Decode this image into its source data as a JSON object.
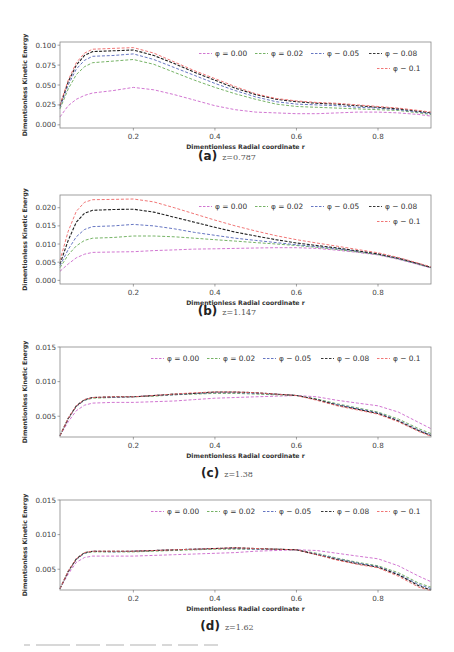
{
  "figure": {
    "footer_text_fragment": "(cut-off caption text)"
  },
  "chart_data": [
    {
      "id": "a",
      "type": "line",
      "caption_letter": "(a)",
      "caption_z": "z=0.787",
      "xlabel": "Dimentionless Radial coordinate r",
      "ylabel": "Dimentionless Kinetic Energy",
      "xlim": [
        0.02,
        0.93
      ],
      "ylim": [
        -0.004,
        0.104
      ],
      "xticks": [
        0.2,
        0.4,
        0.6,
        0.8
      ],
      "xtick_labels": [
        "0.2",
        "0.4",
        "0.6",
        "0.8"
      ],
      "yticks": [
        0.0,
        0.025,
        0.05,
        0.075,
        0.1
      ],
      "ytick_labels": [
        "0.000",
        "0.025",
        "0.050",
        "0.075",
        "0.100"
      ],
      "grid": false,
      "legend_position": "upper right",
      "legend_rows": [
        [
          0,
          1,
          2,
          3
        ],
        [
          4
        ]
      ],
      "x": [
        0.02,
        0.04,
        0.06,
        0.08,
        0.1,
        0.15,
        0.2,
        0.25,
        0.3,
        0.35,
        0.4,
        0.45,
        0.5,
        0.55,
        0.6,
        0.65,
        0.7,
        0.75,
        0.8,
        0.85,
        0.9,
        0.93
      ],
      "series": [
        {
          "name": "φ = 0.00",
          "color": "#cc66cc",
          "values": [
            0.01,
            0.024,
            0.032,
            0.037,
            0.04,
            0.043,
            0.047,
            0.044,
            0.038,
            0.031,
            0.024,
            0.019,
            0.016,
            0.015,
            0.014,
            0.014,
            0.015,
            0.016,
            0.016,
            0.015,
            0.013,
            0.011
          ]
        },
        {
          "name": "φ = 0.02",
          "color": "#66aa55",
          "values": [
            0.02,
            0.045,
            0.063,
            0.073,
            0.078,
            0.08,
            0.082,
            0.076,
            0.066,
            0.056,
            0.047,
            0.039,
            0.032,
            0.026,
            0.023,
            0.022,
            0.021,
            0.02,
            0.019,
            0.018,
            0.015,
            0.013
          ]
        },
        {
          "name": "φ − 0.05",
          "color": "#5566bb",
          "values": [
            0.022,
            0.05,
            0.07,
            0.081,
            0.086,
            0.087,
            0.089,
            0.082,
            0.072,
            0.062,
            0.052,
            0.043,
            0.035,
            0.029,
            0.026,
            0.025,
            0.024,
            0.022,
            0.021,
            0.019,
            0.016,
            0.014
          ]
        },
        {
          "name": "φ − 0.08",
          "color": "#222222",
          "values": [
            0.024,
            0.054,
            0.075,
            0.087,
            0.092,
            0.093,
            0.094,
            0.087,
            0.077,
            0.066,
            0.056,
            0.046,
            0.038,
            0.032,
            0.029,
            0.027,
            0.026,
            0.024,
            0.022,
            0.02,
            0.017,
            0.015
          ]
        },
        {
          "name": "φ − 0.1",
          "color": "#ee6666",
          "values": [
            0.025,
            0.056,
            0.078,
            0.09,
            0.095,
            0.096,
            0.097,
            0.09,
            0.079,
            0.068,
            0.058,
            0.048,
            0.039,
            0.033,
            0.03,
            0.028,
            0.027,
            0.025,
            0.023,
            0.021,
            0.018,
            0.016
          ]
        }
      ]
    },
    {
      "id": "b",
      "type": "line",
      "caption_letter": "(b)",
      "caption_z": "z=1.147",
      "xlabel": "Dimentionless Radial coordinate r",
      "ylabel": "Dimentionless Kinetic Energy",
      "xlim": [
        0.02,
        0.93
      ],
      "ylim": [
        -0.001,
        0.0235
      ],
      "xticks": [
        0.2,
        0.4,
        0.6,
        0.8
      ],
      "xtick_labels": [
        "0.2",
        "0.4",
        "0.6",
        "0.8"
      ],
      "yticks": [
        0.0,
        0.005,
        0.01,
        0.015,
        0.02
      ],
      "ytick_labels": [
        "0.000",
        "0.005",
        "0.010",
        "0.015",
        "0.020"
      ],
      "grid": false,
      "legend_position": "upper right",
      "legend_rows": [
        [
          0,
          1,
          2,
          3
        ],
        [
          4
        ]
      ],
      "x": [
        0.02,
        0.04,
        0.06,
        0.08,
        0.1,
        0.15,
        0.2,
        0.25,
        0.3,
        0.35,
        0.4,
        0.45,
        0.5,
        0.55,
        0.6,
        0.65,
        0.7,
        0.75,
        0.8,
        0.85,
        0.9,
        0.93
      ],
      "series": [
        {
          "name": "φ = 0.00",
          "color": "#cc66cc",
          "values": [
            0.0025,
            0.0045,
            0.0062,
            0.0072,
            0.0077,
            0.0078,
            0.0079,
            0.0082,
            0.0084,
            0.0086,
            0.0087,
            0.0088,
            0.0089,
            0.009,
            0.009,
            0.0088,
            0.0083,
            0.0077,
            0.007,
            0.0058,
            0.0043,
            0.0034
          ]
        },
        {
          "name": "φ = 0.02",
          "color": "#66aa55",
          "values": [
            0.0035,
            0.007,
            0.0095,
            0.011,
            0.0116,
            0.0118,
            0.0122,
            0.0122,
            0.012,
            0.0116,
            0.0112,
            0.0108,
            0.0104,
            0.01,
            0.0096,
            0.0091,
            0.0085,
            0.0078,
            0.0071,
            0.0059,
            0.0044,
            0.0035
          ]
        },
        {
          "name": "φ − 0.05",
          "color": "#5566bb",
          "values": [
            0.004,
            0.0085,
            0.012,
            0.014,
            0.0148,
            0.015,
            0.0154,
            0.015,
            0.0142,
            0.0132,
            0.0124,
            0.0116,
            0.011,
            0.0104,
            0.0098,
            0.0093,
            0.0087,
            0.008,
            0.0072,
            0.006,
            0.0045,
            0.0035
          ]
        },
        {
          "name": "φ − 0.08",
          "color": "#222222",
          "values": [
            0.0045,
            0.011,
            0.016,
            0.0185,
            0.0193,
            0.0195,
            0.0196,
            0.0188,
            0.0174,
            0.016,
            0.0146,
            0.0133,
            0.0122,
            0.0112,
            0.0103,
            0.0096,
            0.0089,
            0.0081,
            0.0073,
            0.0061,
            0.0046,
            0.0036
          ]
        },
        {
          "name": "φ − 0.1",
          "color": "#ee6666",
          "values": [
            0.0055,
            0.0135,
            0.019,
            0.0215,
            0.0222,
            0.0223,
            0.0224,
            0.0216,
            0.02,
            0.0183,
            0.0166,
            0.015,
            0.0136,
            0.0123,
            0.0112,
            0.0103,
            0.0094,
            0.0085,
            0.0076,
            0.0063,
            0.0047,
            0.0037
          ]
        }
      ]
    },
    {
      "id": "c",
      "type": "line",
      "caption_letter": "(c)",
      "caption_z": "z=1.38",
      "xlabel": "Dimentionless Radial coordinate r",
      "ylabel": "Dimentionless Kinetic Energy",
      "xlim": [
        0.02,
        0.93
      ],
      "ylim": [
        0.002,
        0.015
      ],
      "xticks": [
        0.2,
        0.4,
        0.6,
        0.8
      ],
      "xtick_labels": [
        "0.2",
        "0.4",
        "0.6",
        "0.8"
      ],
      "yticks": [
        0.005,
        0.01,
        0.015
      ],
      "ytick_labels": [
        "0.005",
        "0.010",
        "0.015"
      ],
      "grid": false,
      "legend_position": "upper right",
      "legend_rows": [
        [
          0,
          1,
          2,
          3,
          4
        ]
      ],
      "x": [
        0.02,
        0.04,
        0.06,
        0.08,
        0.1,
        0.15,
        0.2,
        0.25,
        0.3,
        0.35,
        0.4,
        0.45,
        0.5,
        0.55,
        0.6,
        0.65,
        0.7,
        0.75,
        0.8,
        0.85,
        0.9,
        0.93
      ],
      "series": [
        {
          "name": "φ = 0.00",
          "color": "#cc66cc",
          "values": [
            0.0022,
            0.0042,
            0.0058,
            0.0066,
            0.0069,
            0.007,
            0.007,
            0.0071,
            0.0072,
            0.0074,
            0.0076,
            0.0077,
            0.0078,
            0.0079,
            0.008,
            0.0078,
            0.0073,
            0.0069,
            0.0065,
            0.0056,
            0.0041,
            0.0032
          ]
        },
        {
          "name": "φ = 0.02",
          "color": "#66aa55",
          "values": [
            0.0022,
            0.0046,
            0.0064,
            0.0073,
            0.0076,
            0.0077,
            0.0078,
            0.0079,
            0.0081,
            0.0082,
            0.0083,
            0.0083,
            0.0082,
            0.0081,
            0.008,
            0.0075,
            0.0068,
            0.0062,
            0.0056,
            0.0046,
            0.0032,
            0.0025
          ]
        },
        {
          "name": "φ − 0.05",
          "color": "#5566bb",
          "values": [
            0.0022,
            0.0046,
            0.0064,
            0.0073,
            0.0077,
            0.0077,
            0.0078,
            0.008,
            0.0081,
            0.0083,
            0.0084,
            0.0084,
            0.0083,
            0.0082,
            0.008,
            0.0074,
            0.0067,
            0.0061,
            0.0055,
            0.0044,
            0.003,
            0.0023
          ]
        },
        {
          "name": "φ − 0.08",
          "color": "#222222",
          "values": [
            0.0022,
            0.0047,
            0.0065,
            0.0074,
            0.0077,
            0.0078,
            0.0078,
            0.008,
            0.0082,
            0.0083,
            0.0085,
            0.0085,
            0.0084,
            0.0082,
            0.008,
            0.0074,
            0.0066,
            0.006,
            0.0054,
            0.0043,
            0.0029,
            0.0022
          ]
        },
        {
          "name": "φ − 0.1",
          "color": "#ee6666",
          "values": [
            0.0022,
            0.0047,
            0.0065,
            0.0074,
            0.0077,
            0.0078,
            0.0078,
            0.008,
            0.0082,
            0.0084,
            0.0085,
            0.0085,
            0.0084,
            0.0082,
            0.008,
            0.0073,
            0.0065,
            0.0059,
            0.0053,
            0.0042,
            0.0028,
            0.0021
          ]
        }
      ]
    },
    {
      "id": "d",
      "type": "line",
      "caption_letter": "(d)",
      "caption_z": "z=1.62",
      "xlabel": "Dimentionless Radial coordinate r",
      "ylabel": "Dimentionless Kinetic Energy",
      "xlim": [
        0.02,
        0.93
      ],
      "ylim": [
        0.002,
        0.015
      ],
      "xticks": [
        0.2,
        0.4,
        0.6,
        0.8
      ],
      "xtick_labels": [
        "0.2",
        "0.4",
        "0.6",
        "0.8"
      ],
      "yticks": [
        0.005,
        0.01,
        0.015
      ],
      "ytick_labels": [
        "0.005",
        "0.010",
        "0.015"
      ],
      "grid": false,
      "legend_position": "upper right",
      "legend_rows": [
        [
          0,
          1,
          2,
          3,
          4
        ]
      ],
      "x": [
        0.02,
        0.04,
        0.06,
        0.08,
        0.1,
        0.15,
        0.2,
        0.25,
        0.3,
        0.35,
        0.4,
        0.45,
        0.5,
        0.55,
        0.6,
        0.65,
        0.7,
        0.75,
        0.8,
        0.85,
        0.9,
        0.93
      ],
      "series": [
        {
          "name": "φ = 0.00",
          "color": "#cc66cc",
          "values": [
            0.0022,
            0.0043,
            0.006,
            0.0067,
            0.0069,
            0.0069,
            0.0069,
            0.007,
            0.0071,
            0.0072,
            0.0073,
            0.0074,
            0.0076,
            0.0077,
            0.0078,
            0.0077,
            0.0073,
            0.0069,
            0.0065,
            0.0055,
            0.004,
            0.0032
          ]
        },
        {
          "name": "φ = 0.02",
          "color": "#66aa55",
          "values": [
            0.0022,
            0.0046,
            0.0064,
            0.0073,
            0.0075,
            0.0075,
            0.0075,
            0.0076,
            0.0077,
            0.0078,
            0.0079,
            0.0079,
            0.0079,
            0.0079,
            0.0078,
            0.0073,
            0.0066,
            0.006,
            0.0055,
            0.0045,
            0.003,
            0.0024
          ]
        },
        {
          "name": "φ − 0.05",
          "color": "#5566bb",
          "values": [
            0.0022,
            0.0046,
            0.0064,
            0.0073,
            0.0076,
            0.0075,
            0.0076,
            0.0077,
            0.0078,
            0.0079,
            0.008,
            0.008,
            0.0079,
            0.0079,
            0.0078,
            0.0072,
            0.0065,
            0.0059,
            0.0054,
            0.0043,
            0.0028,
            0.0022
          ]
        },
        {
          "name": "φ − 0.08",
          "color": "#222222",
          "values": [
            0.0022,
            0.0047,
            0.0065,
            0.0074,
            0.0076,
            0.0076,
            0.0076,
            0.0077,
            0.0078,
            0.0079,
            0.008,
            0.0081,
            0.008,
            0.0079,
            0.0078,
            0.0071,
            0.0064,
            0.0058,
            0.0053,
            0.0042,
            0.0026,
            0.002
          ]
        },
        {
          "name": "φ − 0.1",
          "color": "#ee6666",
          "values": [
            0.0022,
            0.0047,
            0.0065,
            0.0074,
            0.0076,
            0.0076,
            0.0076,
            0.0077,
            0.0078,
            0.0079,
            0.008,
            0.0081,
            0.008,
            0.0079,
            0.0078,
            0.0071,
            0.0063,
            0.0057,
            0.0052,
            0.004,
            0.0024,
            0.0019
          ]
        }
      ]
    }
  ]
}
